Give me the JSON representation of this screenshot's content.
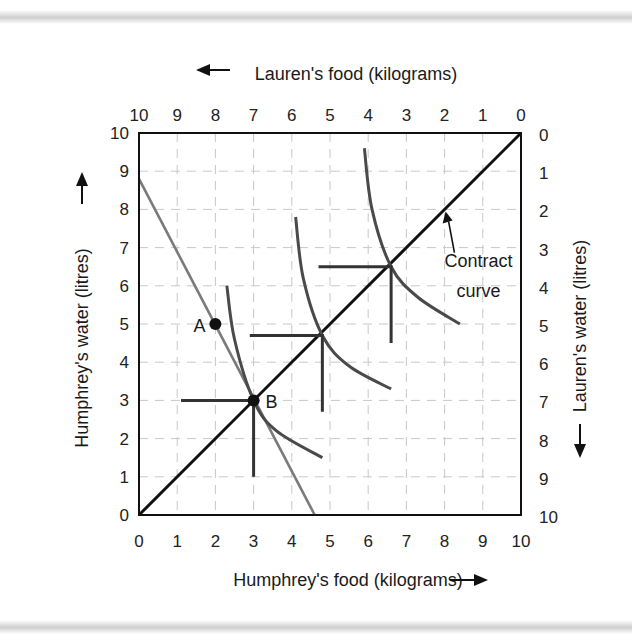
{
  "chart_data": {
    "type": "line",
    "subtype": "edgeworth-box",
    "title": "",
    "axes": {
      "bottom": {
        "label": "Humphrey's food (kilograms)",
        "arrow": "right",
        "ticks": [
          "0",
          "1",
          "2",
          "3",
          "4",
          "5",
          "6",
          "7",
          "8",
          "9",
          "10"
        ]
      },
      "top": {
        "label": "Lauren's food (kilograms)",
        "arrow": "left",
        "ticks": [
          "10",
          "9",
          "8",
          "7",
          "6",
          "5",
          "4",
          "3",
          "2",
          "1",
          "0"
        ]
      },
      "left": {
        "label": "Humphrey's water (litres)",
        "arrow": "up",
        "ticks": [
          "0",
          "1",
          "2",
          "3",
          "4",
          "5",
          "6",
          "7",
          "8",
          "9",
          "10"
        ]
      },
      "right": {
        "label": "Lauren's water (litres)",
        "arrow": "down",
        "ticks": [
          "0",
          "1",
          "2",
          "3",
          "4",
          "5",
          "6",
          "7",
          "8",
          "9",
          "10"
        ]
      }
    },
    "xlim": [
      0,
      10
    ],
    "ylim": [
      0,
      10
    ],
    "grid": "dashed",
    "series": [
      {
        "name": "Contract curve",
        "color": "#111111",
        "points": [
          [
            0,
            0
          ],
          [
            10,
            10
          ]
        ]
      },
      {
        "name": "Budget line",
        "color": "#7a7a7a",
        "points": [
          [
            0,
            8.8
          ],
          [
            4.6,
            0
          ]
        ]
      },
      {
        "name": "Humphrey indifference curve 1",
        "color": "#4a4a4a",
        "points": [
          [
            2.3,
            6.0
          ],
          [
            2.5,
            4.6
          ],
          [
            3.0,
            3.0
          ],
          [
            3.6,
            2.2
          ],
          [
            4.8,
            1.5
          ]
        ]
      },
      {
        "name": "Humphrey indifference curve 2",
        "color": "#4a4a4a",
        "points": [
          [
            4.1,
            7.8
          ],
          [
            4.3,
            6.2
          ],
          [
            4.8,
            4.7
          ],
          [
            5.5,
            3.9
          ],
          [
            6.6,
            3.3
          ]
        ]
      },
      {
        "name": "Humphrey indifference curve 3",
        "color": "#4a4a4a",
        "points": [
          [
            5.9,
            9.6
          ],
          [
            6.1,
            8.0
          ],
          [
            6.6,
            6.5
          ],
          [
            7.3,
            5.7
          ],
          [
            8.4,
            5.0
          ]
        ]
      },
      {
        "name": "Lauren indifference curve 1",
        "color": "#333333",
        "points": [
          [
            1.1,
            3.0
          ],
          [
            3.0,
            3.0
          ],
          [
            3.0,
            1.0
          ]
        ]
      },
      {
        "name": "Lauren indifference curve 2",
        "color": "#333333",
        "points": [
          [
            2.9,
            4.7
          ],
          [
            4.8,
            4.7
          ],
          [
            4.8,
            2.7
          ]
        ]
      },
      {
        "name": "Lauren indifference curve 3",
        "color": "#333333",
        "points": [
          [
            4.7,
            6.5
          ],
          [
            6.6,
            6.5
          ],
          [
            6.6,
            4.5
          ]
        ]
      }
    ],
    "points": [
      {
        "label": "A",
        "x": 2,
        "y": 5
      },
      {
        "label": "B",
        "x": 3,
        "y": 3
      }
    ],
    "annotations": [
      {
        "text": "Contract curve",
        "arrow_to": [
          8.0,
          8.0
        ],
        "text_at": [
          8.1,
          6.5
        ]
      }
    ]
  }
}
